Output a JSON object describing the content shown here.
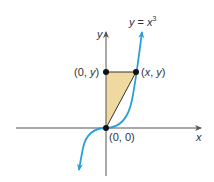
{
  "diagram": {
    "curve_label": {
      "lhs": "y",
      "eq": " = ",
      "rhs": "x",
      "exp": "3"
    },
    "axes": {
      "x_label": "x",
      "y_label": "y"
    },
    "points": {
      "origin": "(0, 0)",
      "y_axis_point": {
        "open": "(0, ",
        "var": "y",
        "close": ")"
      },
      "curve_point": {
        "open": "(",
        "v1": "x",
        "sep": ", ",
        "v2": "y",
        "close": ")"
      }
    },
    "colors": {
      "curve": "#2aa0d8",
      "axis": "#555555",
      "fill": "#f0d9a0",
      "point": "#111111"
    }
  }
}
